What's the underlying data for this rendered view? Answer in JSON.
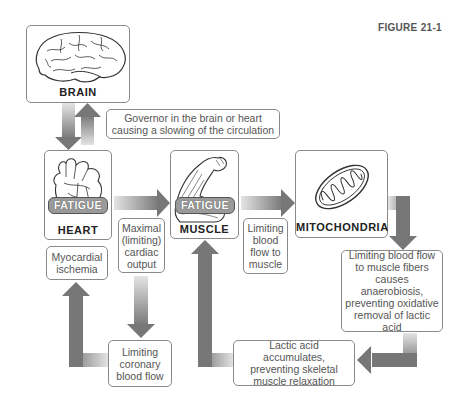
{
  "figure": {
    "label": "FIGURE 21-1"
  },
  "nodes": {
    "brain": {
      "label": "BRAIN",
      "icon": "brain-icon"
    },
    "heart": {
      "label": "HEART",
      "badge": "FATIGUE",
      "icon": "heart-icon"
    },
    "muscle": {
      "label": "MUSCLE",
      "badge": "FATIGUE",
      "icon": "flexed-arm-icon"
    },
    "mitochondria": {
      "label": "MITOCHONDRIA",
      "icon": "mitochondria-icon"
    }
  },
  "notes": {
    "governor": [
      "Governor in the brain or heart",
      "causing a slowing of the circulation"
    ],
    "maximal_output": [
      "Maximal",
      "(limiting)",
      "cardiac",
      "output"
    ],
    "limiting_blood_flow_muscle": [
      "Limiting",
      "blood",
      "flow to",
      "muscle"
    ],
    "myocardial_ischemia": [
      "Myocardial",
      "ischemia"
    ],
    "limiting_coronary": [
      "Limiting",
      "coronary",
      "blood flow"
    ],
    "anaerobiosis": [
      "Limiting blood flow",
      "to muscle fibers",
      "causes anaerobiosis,",
      "preventing oxidative",
      "removal of lactic",
      "acid"
    ],
    "lactic_acid": [
      "Lactic acid accumulates,",
      "preventing skeletal",
      "muscle relaxation"
    ]
  },
  "colors": {
    "arrow": "#7d7d7d",
    "arrow_light": "#e2e2e2",
    "border": "#8a8a8a",
    "badge": "#9a9a9a"
  }
}
